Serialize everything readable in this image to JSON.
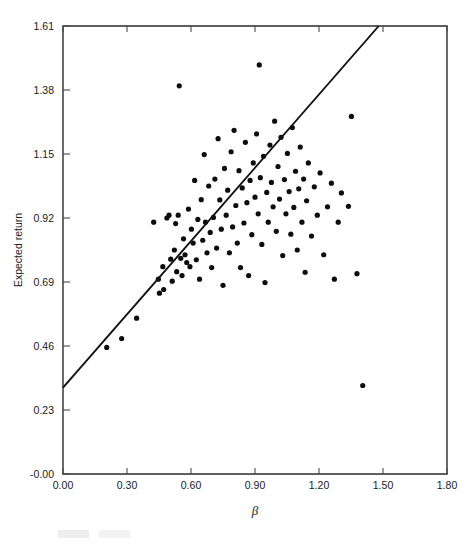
{
  "figure": {
    "width": 476,
    "height": 546,
    "background": "#ffffff",
    "ink_color": "#111111"
  },
  "axes": {
    "x_title": "β",
    "y_title": "Expected return",
    "x_tick_labels": [
      "0.00",
      "0.30",
      "0.60",
      "0.90",
      "1.20",
      "1.50",
      "1.80"
    ],
    "y_tick_labels": [
      "-0.00",
      "0.23",
      "0.46",
      "0.69",
      "0.92",
      "1.15",
      "1.38",
      "1.61"
    ],
    "frame": {
      "left": 63,
      "right": 447,
      "top": 26,
      "bottom": 474
    }
  },
  "chart_data": {
    "type": "scatter",
    "title": "",
    "subtitle": "",
    "xlabel": "β",
    "ylabel": "Expected return",
    "xlim": [
      0.0,
      1.8
    ],
    "ylim": [
      0.0,
      1.61
    ],
    "xticks": [
      0.0,
      0.3,
      0.6,
      0.9,
      1.2,
      1.5,
      1.8
    ],
    "yticks": [
      0.0,
      0.23,
      0.46,
      0.69,
      0.92,
      1.15,
      1.38,
      1.61
    ],
    "grid": false,
    "legend": null,
    "marker": {
      "shape": "circle",
      "size_px": 3.4,
      "color": "#0d0d0d"
    },
    "fit_line": {
      "label": "security market line",
      "x": [
        0.0,
        1.48
      ],
      "y": [
        0.31,
        1.61
      ],
      "slope": 0.878,
      "intercept": 0.31,
      "color": "#111111",
      "width_px": 1.9
    },
    "points": [
      [
        0.205,
        0.455
      ],
      [
        0.275,
        0.487
      ],
      [
        0.345,
        0.56
      ],
      [
        0.425,
        0.905
      ],
      [
        0.447,
        0.7
      ],
      [
        0.452,
        0.65
      ],
      [
        0.468,
        0.745
      ],
      [
        0.472,
        0.663
      ],
      [
        0.487,
        0.92
      ],
      [
        0.497,
        0.93
      ],
      [
        0.505,
        0.772
      ],
      [
        0.512,
        0.693
      ],
      [
        0.522,
        0.805
      ],
      [
        0.528,
        0.9
      ],
      [
        0.533,
        0.727
      ],
      [
        0.54,
        0.93
      ],
      [
        0.545,
        1.395
      ],
      [
        0.552,
        0.775
      ],
      [
        0.558,
        0.713
      ],
      [
        0.565,
        0.845
      ],
      [
        0.572,
        0.788
      ],
      [
        0.58,
        0.76
      ],
      [
        0.588,
        0.952
      ],
      [
        0.595,
        0.745
      ],
      [
        0.602,
        0.88
      ],
      [
        0.61,
        0.83
      ],
      [
        0.617,
        1.055
      ],
      [
        0.625,
        0.77
      ],
      [
        0.632,
        0.915
      ],
      [
        0.64,
        0.7
      ],
      [
        0.648,
        0.986
      ],
      [
        0.655,
        0.84
      ],
      [
        0.662,
        1.148
      ],
      [
        0.668,
        0.905
      ],
      [
        0.675,
        0.795
      ],
      [
        0.683,
        1.035
      ],
      [
        0.69,
        0.868
      ],
      [
        0.697,
        0.742
      ],
      [
        0.705,
        0.922
      ],
      [
        0.712,
        1.06
      ],
      [
        0.72,
        0.812
      ],
      [
        0.727,
        1.205
      ],
      [
        0.735,
        0.985
      ],
      [
        0.742,
        0.88
      ],
      [
        0.75,
        0.678
      ],
      [
        0.757,
        1.098
      ],
      [
        0.765,
        0.93
      ],
      [
        0.772,
        1.02
      ],
      [
        0.78,
        0.795
      ],
      [
        0.788,
        1.158
      ],
      [
        0.795,
        0.888
      ],
      [
        0.802,
        1.235
      ],
      [
        0.81,
        0.965
      ],
      [
        0.817,
        0.83
      ],
      [
        0.825,
        1.09
      ],
      [
        0.832,
        0.742
      ],
      [
        0.84,
        1.028
      ],
      [
        0.848,
        0.902
      ],
      [
        0.855,
        1.192
      ],
      [
        0.862,
        0.975
      ],
      [
        0.87,
        0.713
      ],
      [
        0.877,
        1.055
      ],
      [
        0.885,
        0.86
      ],
      [
        0.892,
        1.118
      ],
      [
        0.9,
        0.995
      ],
      [
        0.907,
        1.222
      ],
      [
        0.915,
        0.935
      ],
      [
        0.92,
        1.47
      ],
      [
        0.925,
        1.065
      ],
      [
        0.932,
        0.825
      ],
      [
        0.94,
        1.142
      ],
      [
        0.947,
        0.688
      ],
      [
        0.955,
        1.012
      ],
      [
        0.962,
        0.905
      ],
      [
        0.97,
        1.182
      ],
      [
        0.977,
        1.048
      ],
      [
        0.985,
        0.96
      ],
      [
        0.992,
        1.268
      ],
      [
        1.0,
        0.872
      ],
      [
        1.008,
        1.105
      ],
      [
        1.015,
        0.988
      ],
      [
        1.022,
        1.21
      ],
      [
        1.03,
        0.785
      ],
      [
        1.038,
        1.058
      ],
      [
        1.045,
        0.935
      ],
      [
        1.052,
        1.152
      ],
      [
        1.06,
        1.015
      ],
      [
        1.068,
        0.862
      ],
      [
        1.075,
        1.245
      ],
      [
        1.082,
        0.958
      ],
      [
        1.09,
        1.088
      ],
      [
        1.098,
        0.805
      ],
      [
        1.105,
        1.025
      ],
      [
        1.112,
        1.175
      ],
      [
        1.12,
        0.905
      ],
      [
        1.128,
        1.06
      ],
      [
        1.135,
        0.725
      ],
      [
        1.142,
        0.982
      ],
      [
        1.15,
        1.118
      ],
      [
        1.165,
        0.855
      ],
      [
        1.178,
        1.032
      ],
      [
        1.192,
        0.93
      ],
      [
        1.205,
        1.082
      ],
      [
        1.222,
        0.788
      ],
      [
        1.24,
        0.96
      ],
      [
        1.258,
        1.045
      ],
      [
        1.272,
        0.7
      ],
      [
        1.29,
        0.905
      ],
      [
        1.305,
        1.01
      ],
      [
        1.338,
        0.962
      ],
      [
        1.352,
        1.285
      ],
      [
        1.378,
        0.72
      ],
      [
        1.405,
        0.318
      ]
    ]
  }
}
